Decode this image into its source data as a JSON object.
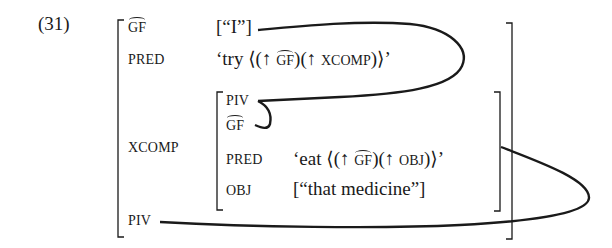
{
  "example_number": "(31)",
  "outer": {
    "gf_label": "GF",
    "gf_value": "[“I”]",
    "pred_label": "PRED",
    "pred_value_prefix": "‘try ⟨(↑ ",
    "pred_value_gf": "GF",
    "pred_value_mid": ")(↑ ",
    "pred_value_xcomp": "XCOMP",
    "pred_value_suffix": ")⟩’",
    "xcomp_label": "XCOMP",
    "piv_label": "PIV"
  },
  "inner": {
    "piv_label": "PIV",
    "gf_label": "GF",
    "pred_label": "PRED",
    "pred_value_prefix": "‘eat ⟨(↑ ",
    "pred_value_gf": "GF",
    "pred_value_mid": ")(↑ ",
    "pred_value_obj": "OBJ",
    "pred_value_suffix": ")⟩’",
    "obj_label": "OBJ",
    "obj_value": "[“that medicine”]"
  },
  "colors": {
    "ink": "#1a1a1a",
    "background": "#ffffff"
  }
}
